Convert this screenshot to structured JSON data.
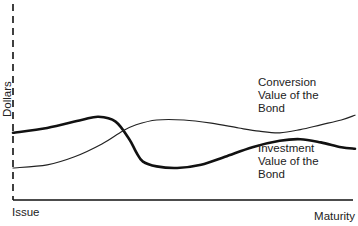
{
  "chart_data": {
    "type": "line",
    "title": "",
    "xlabel": "",
    "ylabel": "Dollars",
    "x_tick_labels": [
      "Issue",
      "Maturity"
    ],
    "xlim": [
      0,
      100
    ],
    "ylim": [
      0,
      100
    ],
    "grid": false,
    "legend": "none",
    "series": [
      {
        "name": "Investment Value of the Bond",
        "label_lines": [
          "Investment",
          "Value of the",
          "Bond"
        ],
        "style": "thick",
        "color": "#111111",
        "x": [
          0,
          10,
          20,
          25,
          30,
          34,
          36,
          38,
          42,
          48,
          55,
          62,
          70,
          78,
          84,
          90,
          96,
          100
        ],
        "y": [
          42,
          45,
          50,
          52,
          49,
          38,
          30,
          24,
          21,
          20,
          22,
          27,
          33,
          37,
          38,
          36,
          33,
          32
        ]
      },
      {
        "name": "Conversion Value of the Bond",
        "label_lines": [
          "Conversion",
          "Value of the",
          "Bond"
        ],
        "style": "thin",
        "color": "#222222",
        "x": [
          0,
          10,
          18,
          26,
          32,
          36,
          42,
          50,
          58,
          66,
          72,
          78,
          84,
          90,
          96,
          100
        ],
        "y": [
          20,
          22,
          27,
          35,
          43,
          47,
          50,
          50,
          48,
          45,
          43,
          42,
          44,
          47,
          50,
          53
        ]
      }
    ]
  }
}
